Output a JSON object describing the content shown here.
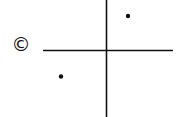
{
  "diagram": {
    "type": "coordinate-plane-sketch",
    "label": "©",
    "colors": {
      "background": "#ffffff",
      "ink": "#111111"
    },
    "axes": {
      "horizontal": {
        "x1": 43,
        "x2": 173,
        "y": 50.5
      },
      "vertical": {
        "x": 106.5,
        "y1": 0,
        "y2": 117
      }
    },
    "points": [
      {
        "name": "point-quadrant-1",
        "x": 128,
        "y": 16,
        "r": 2.2
      },
      {
        "name": "point-quadrant-3",
        "x": 61,
        "y": 76.5,
        "r": 2.2
      }
    ]
  }
}
